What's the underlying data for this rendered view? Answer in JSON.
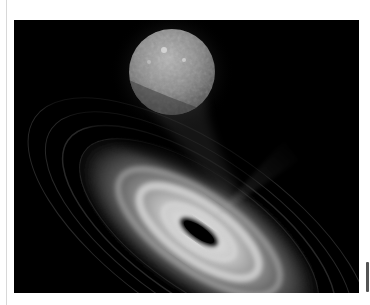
{
  "image": {
    "subject": "tidal disruption event illustration",
    "description": "Grayscale artist illustration of a star being pulled toward a black hole surrounded by a bright swirling accretion disk with a faint jet",
    "elements": {
      "star": "textured spherical star at top center",
      "black_hole": "dark elliptical shadow at center of accretion disk",
      "accretion_disk": "bright tilted swirl of streaks in lower portion",
      "jet": "faint cone of light emanating toward upper right"
    },
    "colors": {
      "background": "#000000",
      "page": "#ffffff",
      "disk_bright": "#d9d9d9",
      "star": "#9a9a9a"
    }
  }
}
